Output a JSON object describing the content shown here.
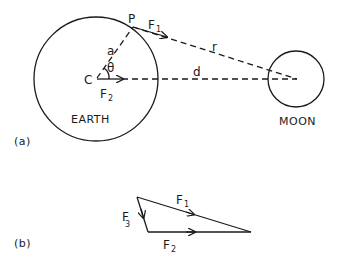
{
  "figure": {
    "part_a": {
      "label": "(a)",
      "earth": {
        "label": "EARTH",
        "center_label": "C",
        "point_label": "P",
        "radius_label": "a",
        "angle_label": "θ"
      },
      "moon": {
        "label": "MOON"
      },
      "distances": {
        "r_label": "r",
        "d_label": "d"
      },
      "forces": {
        "f1": {
          "main": "F",
          "sub": "1"
        },
        "f2": {
          "main": "F",
          "sub": "2"
        }
      }
    },
    "part_b": {
      "label": "(b)",
      "forces": {
        "f1": {
          "main": "F",
          "sub": "1"
        },
        "f2": {
          "main": "F",
          "sub": "2"
        },
        "f3": {
          "main": "F",
          "sub": "3"
        }
      }
    }
  },
  "colors": {
    "ink": "#1a1a1a",
    "background": "#ffffff"
  }
}
